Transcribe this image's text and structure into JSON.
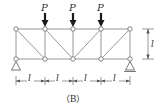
{
  "diagram": {
    "type": "truss",
    "caption": "（B）",
    "load_label": "P",
    "span_label": "l",
    "height_label": "l",
    "panels": 4,
    "top_nodes_x": [
      16,
      45,
      73,
      101,
      130
    ],
    "top_y": 29,
    "bottom_y": 59,
    "loads": [
      {
        "label": "P",
        "x": 45
      },
      {
        "label": "P",
        "x": 73
      },
      {
        "label": "P",
        "x": 101
      }
    ],
    "dimensions": {
      "spans": [
        "l",
        "l",
        "l",
        "l"
      ],
      "height": "l"
    },
    "supports": [
      {
        "type": "pin",
        "x": 16
      },
      {
        "type": "roller",
        "x": 130
      }
    ]
  }
}
